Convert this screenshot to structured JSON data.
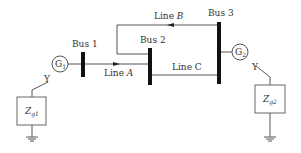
{
  "diagram": {
    "type": "power-system-one-line",
    "buses": [
      {
        "id": "bus1",
        "label": "Bus 1"
      },
      {
        "id": "bus2",
        "label": "Bus 2"
      },
      {
        "id": "bus3",
        "label": "Bus 3"
      }
    ],
    "generators": [
      {
        "id": "g1",
        "label": "G",
        "sub": "1",
        "bus": "bus1"
      },
      {
        "id": "g2",
        "label": "G",
        "sub": "2",
        "bus": "bus3"
      }
    ],
    "lines": [
      {
        "id": "lineA",
        "label": "Line ",
        "letter": "A",
        "from": "bus1",
        "to": "bus2"
      },
      {
        "id": "lineB",
        "label": "Line ",
        "letter": "B",
        "from": "bus3",
        "to": "bus2"
      },
      {
        "id": "lineC",
        "label": "Line ",
        "letter": "C",
        "from": "bus2",
        "to": "bus3"
      }
    ],
    "grounding": [
      {
        "id": "zg1",
        "label": "Z",
        "sub": "g1",
        "wye": "Y"
      },
      {
        "id": "zg2",
        "label": "Z",
        "sub": "g2",
        "wye": "Y"
      }
    ]
  }
}
